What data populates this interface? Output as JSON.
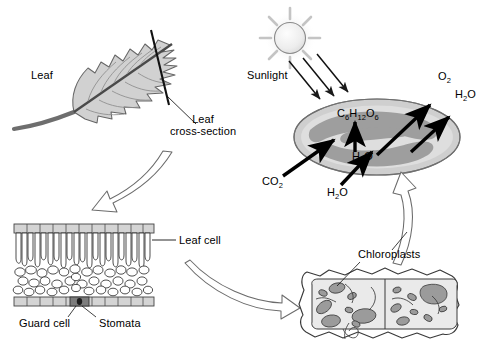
{
  "diagram": {
    "colors": {
      "ink": "#000000",
      "leaf_fill": "#c9c9c9",
      "leaf_stroke": "#5a5a5a",
      "chloroplast_band": "#9a9a9a",
      "chloroplast_light": "#d6d6d6",
      "cell_fill": "#e8e8e8",
      "organelle": "#9b9b9b",
      "hollow_arrow_stroke": "#6b6b6b",
      "sun_fill": "#ededed"
    }
  },
  "leaf_panel": {
    "leaf_label": "Leaf",
    "cross_section_label_line1": "Leaf",
    "cross_section_label_line2": "cross-section"
  },
  "chloroplast_panel": {
    "sunlight_label": "Sunlight",
    "glucose": {
      "element1": "C",
      "sub1": "6",
      "element2": "H",
      "sub2": "12",
      "element3": "O",
      "sub3": "6"
    },
    "water_inside": {
      "element1": "H",
      "sub1": "2",
      "element2": "O"
    },
    "co2_in": {
      "element1": "CO",
      "sub1": "2"
    },
    "water_in": {
      "element1": "H",
      "sub1": "2",
      "element2": "O"
    },
    "o2_out": {
      "element1": "O",
      "sub1": "2"
    },
    "water_out": {
      "element1": "H",
      "sub1": "2",
      "element2": "O"
    }
  },
  "cross_section_panel": {
    "leaf_cell_label": "Leaf cell",
    "guard_cell_label": "Guard cell",
    "stomata_label": "Stomata"
  },
  "cell_panel": {
    "chloroplasts_label": "Chloroplasts"
  }
}
